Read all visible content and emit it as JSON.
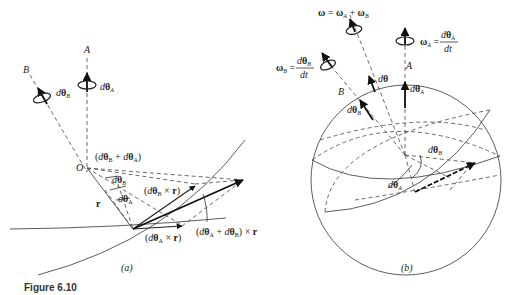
{
  "figure": {
    "caption": "Figure 6.10",
    "panels": [
      {
        "id": "a",
        "label": "(a)",
        "axis_labels": {
          "A": "A",
          "B": "B",
          "origin": "O"
        },
        "rotation_labels": {
          "A": "dθ_A",
          "B": "dθ_B"
        },
        "vector_labels": {
          "sum_angle": "(dθ_B + dθ_A)",
          "angle_B": "dθ_B",
          "angle_A": "dθ_A",
          "r": "r",
          "cross_B": "(dθ_B × r)",
          "cross_A": "(dθ_A × r)",
          "cross_sum": "(dθ_A + dθ_B) × r"
        }
      },
      {
        "id": "b",
        "label": "(b)",
        "omega_total": "ω = ω_A + ω_B",
        "omega_A": "ω_A = dθ_A / dt",
        "omega_B": "ω_B = dθ_B / dt",
        "axis_labels": {
          "A": "A",
          "B": "B"
        },
        "vector_labels": {
          "dtheta": "dθ",
          "dtheta_A": "dθ_A",
          "dtheta_B": "dθ_B"
        },
        "angle_labels": {
          "A": "dθ_A",
          "B": "dθ_B"
        }
      }
    ]
  },
  "text": {
    "a_A": "A",
    "a_B": "B",
    "a_O": "O",
    "a_dthA_d": "d",
    "a_dthA_th": "θ",
    "a_dthA_sub": "A",
    "a_dthB_d": "d",
    "a_dthB_th": "θ",
    "a_dthB_sub": "B",
    "a_sum": "(dθB + dθA)",
    "a_angB": "dθB",
    "a_angA": "dθA",
    "a_r": "r",
    "a_crossB": "(dθB × r)",
    "a_crossA": "(dθA × r)",
    "a_crossSum": "(dθA + dθB) × r",
    "a_panel": "(a)",
    "b_omega": "ω  = ωA + ωB",
    "b_omegaA_lhs": "ωA =",
    "b_omegaA_num": "dθA",
    "b_omegaA_den": "dt",
    "b_omegaB_lhs": "ωB =",
    "b_omegaB_num": "dθB",
    "b_omegaB_den": "dt",
    "b_A": "A",
    "b_B": "B",
    "b_dth": "dθ",
    "b_dthA": "dθA",
    "b_dthB": "dθB",
    "b_angB": "dθB",
    "b_angA": "dθA",
    "b_panel": "(b)",
    "caption": "Figure 6.10"
  }
}
